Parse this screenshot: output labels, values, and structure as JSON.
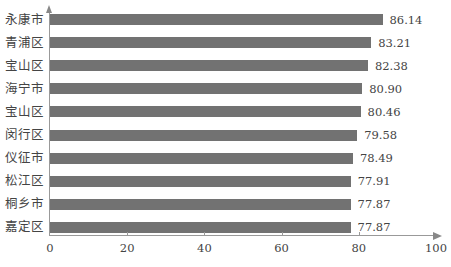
{
  "chart_data": {
    "type": "bar",
    "orientation": "horizontal",
    "title": "",
    "xlabel": "",
    "ylabel": "",
    "xlim": [
      0,
      100
    ],
    "x_ticks": [
      0,
      20,
      40,
      60,
      80,
      100
    ],
    "grid": false,
    "legend": null,
    "bar_color": "#727272",
    "categories": [
      "永康市",
      "青浦区",
      "宝山区",
      "海宁市",
      "宝山区",
      "闵行区",
      "仪征市",
      "松江区",
      "桐乡市",
      "嘉定区"
    ],
    "values": [
      86.14,
      83.21,
      82.38,
      80.9,
      80.46,
      79.58,
      78.49,
      77.91,
      77.87,
      77.87
    ],
    "value_labels": [
      "86.14",
      "83.21",
      "82.38",
      "80.90",
      "80.46",
      "79.58",
      "78.49",
      "77.91",
      "77.87",
      "77.87"
    ]
  }
}
